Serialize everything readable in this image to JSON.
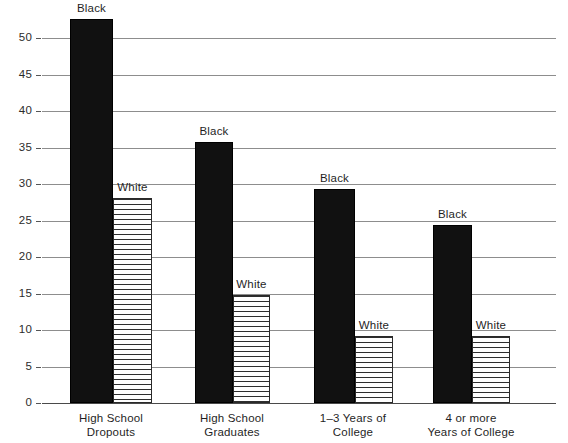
{
  "chart_data": {
    "type": "bar",
    "title": "",
    "subtitle": "",
    "xlabel": "",
    "ylabel": "",
    "ylim": [
      0,
      53
    ],
    "yticks": [
      0,
      5,
      10,
      15,
      20,
      25,
      30,
      35,
      40,
      45,
      50
    ],
    "ytick_labels": [
      "0",
      "5",
      "10",
      "15",
      "20",
      "25",
      "30",
      "35",
      "40",
      "45",
      "50"
    ],
    "grid": true,
    "legend_position": "above-bars",
    "categories": [
      "High School\nDropouts",
      "High School\nGraduates",
      "1–3 Years of\nCollege",
      "4 or more\nYears of College"
    ],
    "category_lines": [
      [
        "High School",
        "Dropouts"
      ],
      [
        "High School",
        "Graduates"
      ],
      [
        "1–3 Years of",
        "College"
      ],
      [
        "4 or more",
        "Years of College"
      ]
    ],
    "series": [
      {
        "name": "Black",
        "values": [
          52.6,
          35.8,
          29.3,
          24.4
        ],
        "color": "#111111",
        "pattern": "solid"
      },
      {
        "name": "White",
        "values": [
          28.1,
          14.8,
          9.2,
          9.2
        ],
        "color": "#ffffff",
        "pattern": "horizontal-lines"
      }
    ],
    "bar_labels": [
      {
        "text": "Black",
        "group": 0,
        "series": 0
      },
      {
        "text": "White",
        "group": 0,
        "series": 1
      },
      {
        "text": "Black",
        "group": 1,
        "series": 0
      },
      {
        "text": "White",
        "group": 1,
        "series": 1
      },
      {
        "text": "Black",
        "group": 2,
        "series": 0
      },
      {
        "text": "White",
        "group": 2,
        "series": 1
      },
      {
        "text": "Black",
        "group": 3,
        "series": 0
      },
      {
        "text": "White",
        "group": 3,
        "series": 1
      }
    ],
    "colors": {
      "black_series": "#111111",
      "white_series": "#ffffff",
      "gridline": "#8d8d8d",
      "axis": "#4a4a4a",
      "text": "#1f1f1f",
      "background": "#ffffff"
    }
  },
  "layout": {
    "baseline_y": 403,
    "top_y": 38,
    "px_per_unit": 7.3,
    "grid_left": 42,
    "grid_right": 556,
    "tick_label_x": 6,
    "groups": [
      {
        "black_x": 70,
        "black_w": 43,
        "white_x": 113,
        "white_w": 39,
        "label_center": 111
      },
      {
        "black_x": 195,
        "black_w": 38,
        "white_x": 233,
        "white_w": 37,
        "label_center": 232
      },
      {
        "black_x": 314,
        "black_w": 41,
        "white_x": 355,
        "white_w": 38,
        "label_center": 353
      },
      {
        "black_x": 433,
        "black_w": 39,
        "white_x": 472,
        "white_w": 38,
        "label_center": 471
      }
    ]
  }
}
